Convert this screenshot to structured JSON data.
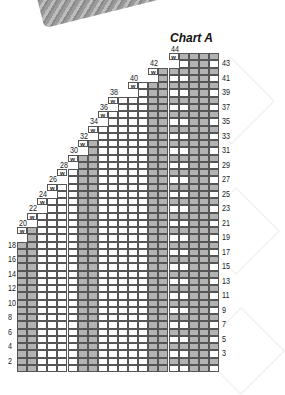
{
  "title": "Chart A",
  "wrap_symbol": "w",
  "colors": {
    "shaded": "#b3b3b3",
    "plain": "#ffffff",
    "grid_line": "#555555",
    "cable_line": "#222222"
  },
  "grid": {
    "columns": 20,
    "rows": 44,
    "x0": 17,
    "x1": 219,
    "y_bottom": 372,
    "row_h": 7.25
  },
  "right_row_labels": [
    "43",
    "41",
    "39",
    "37",
    "35",
    "33",
    "31",
    "29",
    "27",
    "25",
    "23",
    "21",
    "19",
    "17",
    "15",
    "13",
    "11",
    "9",
    "7",
    "5",
    "3"
  ],
  "left_row_labels": [
    "18",
    "16",
    "14",
    "12",
    "10",
    "8",
    "6",
    "4",
    "2"
  ],
  "step_labels": [
    {
      "row": "20",
      "col": 1
    },
    {
      "row": "22",
      "col": 2
    },
    {
      "row": "24",
      "col": 3
    },
    {
      "row": "26",
      "col": 4
    },
    {
      "row": "28",
      "col": 5
    },
    {
      "row": "30",
      "col": 6
    },
    {
      "row": "32",
      "col": 7
    },
    {
      "row": "34",
      "col": 8
    },
    {
      "row": "36",
      "col": 9
    },
    {
      "row": "38",
      "col": 10
    },
    {
      "row": "40",
      "col": 12
    },
    {
      "row": "42",
      "col": 14
    },
    {
      "row": "44",
      "col": 16
    }
  ],
  "shaded_column_bands": [
    {
      "cols": [
        0,
        1
      ]
    },
    {
      "cols": [
        6,
        7
      ]
    },
    {
      "cols": [
        13,
        14
      ]
    },
    {
      "cols": [
        17,
        18
      ]
    }
  ]
}
